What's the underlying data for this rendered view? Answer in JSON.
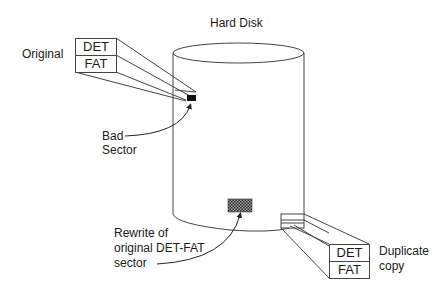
{
  "title": "Hard Disk",
  "original": {
    "label": "Original",
    "rows": [
      "DET",
      "FAT"
    ]
  },
  "duplicate": {
    "label_line1": "Duplicate",
    "label_line2": "copy",
    "rows": [
      "DET",
      "FAT"
    ]
  },
  "bad_sector": {
    "line1": "Bad",
    "line2": "Sector"
  },
  "rewrite": {
    "line1": "Rewrite of",
    "line2": "original DET-FAT",
    "line3": "sector"
  },
  "colors": {
    "stroke": "#333333",
    "bad_sector_fill": "#111111",
    "rewrite_fill": "#555555"
  }
}
